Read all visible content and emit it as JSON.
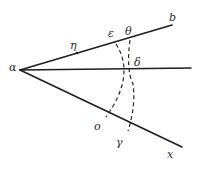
{
  "figure": {
    "labels": {
      "vertex": "α",
      "upper_end": "b",
      "lower_end": "x",
      "eta": "η",
      "epsilon": "ε",
      "theta": "θ",
      "delta": "δ",
      "omicron": "o",
      "gamma": "γ"
    },
    "colors": {
      "line": "#1e1e1e",
      "background": "#ffffff"
    }
  }
}
